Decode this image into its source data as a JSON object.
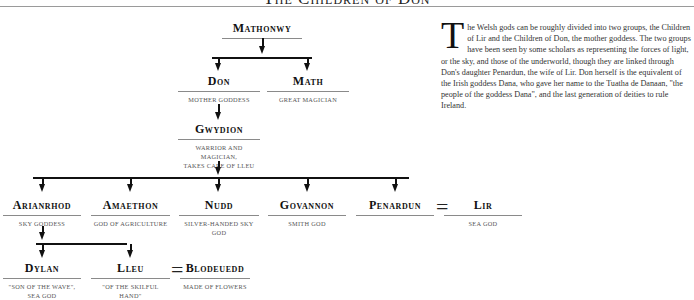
{
  "page": {
    "title": "The Children of Don"
  },
  "tree": {
    "gen1": [
      {
        "id": "mathonwy",
        "name": "Mathonwy",
        "desc": ""
      }
    ],
    "gen2": [
      {
        "id": "don",
        "name": "Don",
        "desc": "Mother Goddess"
      },
      {
        "id": "math",
        "name": "Math",
        "desc": "Great Magician"
      }
    ],
    "gen3": [
      {
        "id": "gwydion",
        "name": "Gwydion",
        "desc_line1": "Warrior and Magician,",
        "desc_line2": "takes care of Lleu"
      }
    ],
    "gen4": [
      {
        "id": "arianrhod",
        "name": "Arianrhod",
        "desc": "Sky Goddess"
      },
      {
        "id": "amaethon",
        "name": "Amaethon",
        "desc": "God of Agriculture"
      },
      {
        "id": "nudd",
        "name": "Nudd",
        "desc": "Silver-handed Sky God"
      },
      {
        "id": "govannon",
        "name": "Govannon",
        "desc": "Smith God"
      },
      {
        "id": "penardun",
        "name": "Penardun",
        "desc": ""
      },
      {
        "id": "lir",
        "name": "Lir",
        "desc": "Sea God"
      }
    ],
    "gen5": [
      {
        "id": "dylan",
        "name": "Dylan",
        "desc_line1": "\"Son of the Wave\",",
        "desc_line2": "Sea God"
      },
      {
        "id": "lleu",
        "name": "Lleu",
        "desc": "\"Of the Skilful Hand\""
      },
      {
        "id": "blodeuedd",
        "name": "Blodeuedd",
        "desc": "Made of Flowers"
      }
    ],
    "marriage_symbol": "="
  },
  "text": {
    "dropcap": "T",
    "body": "he Welsh gods can be roughly divided into two groups, the Children of Lir and the Children of Don, the mother goddess. The two groups have been seen by some scholars as representing the forces of light, or the sky, and those of the underworld, though they are linked through Don's daughter Penardun, the wife of Lir. Don herself is the equivalent of the Irish goddess Dana, who gave her name to the Tuatha de Danaan, \"the people of the goddess Dana\", and the last generation of deities to rule Ireland."
  }
}
